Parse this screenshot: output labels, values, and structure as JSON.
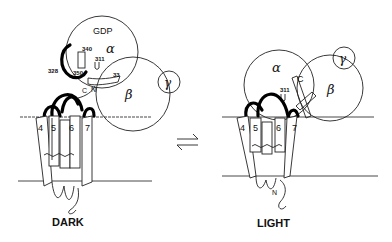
{
  "figure": {
    "type": "schematic diagram",
    "panels": [
      {
        "id": "dark",
        "label": "DARK",
        "subunits": {
          "alpha": "α",
          "beta": "β",
          "gamma": "γ",
          "nucleotide": "GDP"
        },
        "residue_labels": [
          "340",
          "311",
          "328",
          "350",
          "C",
          "N",
          "33"
        ],
        "helix_labels": [
          "4",
          "5",
          "6",
          "7"
        ]
      },
      {
        "id": "light",
        "label": "LIGHT",
        "subunits": {
          "alpha": "α",
          "beta": "β",
          "gamma": "γ"
        },
        "residue_labels": [
          "C",
          "311",
          "N"
        ],
        "helix_labels": [
          "4",
          "5",
          "6",
          "7"
        ]
      }
    ],
    "equilibrium_symbol": "⇌"
  }
}
